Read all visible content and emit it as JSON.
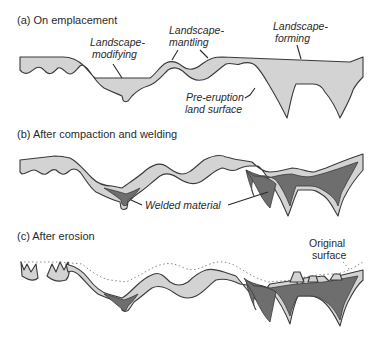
{
  "figure": {
    "panels": [
      {
        "id": "a",
        "title": "(a)  On emplacement",
        "labels": {
          "modifying_line1": "Landscape-",
          "modifying_line2": "modifying",
          "mantling_line1": "Landscape-",
          "mantling_line2": "mantling",
          "forming_line1": "Landscape-",
          "forming_line2": "forming",
          "pre_eruption_line1": "Pre-eruption",
          "pre_eruption_line2": "land surface"
        }
      },
      {
        "id": "b",
        "title": "(b)  After compaction and welding",
        "labels": {
          "welded": "Welded material"
        }
      },
      {
        "id": "c",
        "title": "(c)  After erosion",
        "labels": {
          "original_line1": "Original",
          "original_line2": "surface"
        }
      }
    ],
    "colors": {
      "ignimbrite_light": "#d3d3d3",
      "welded_dark": "#6e6e6e",
      "outline": "#3a3a3a",
      "original_surface_dotted": "#8a8a8a"
    }
  }
}
